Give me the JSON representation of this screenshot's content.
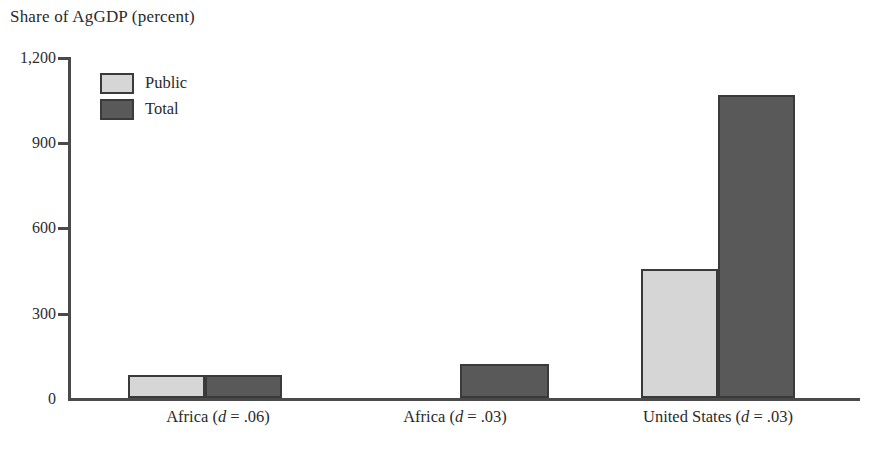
{
  "chart_data": {
    "type": "bar",
    "title": "Share of AgGDP (percent)",
    "xlabel": "",
    "ylabel": "Share of AgGDP (percent)",
    "ylim": [
      0,
      1200
    ],
    "yticks": [
      0,
      300,
      600,
      900,
      1200
    ],
    "ytick_labels": [
      "0",
      "300",
      "600",
      "900",
      "1,200"
    ],
    "grid": false,
    "legend_position": "upper-left",
    "categories": [
      "Africa (d = .06)",
      "Africa (d = .03)",
      "United States (d = .03)"
    ],
    "category_labels_rich": [
      {
        "prefix": "Africa (",
        "italic": "d",
        "suffix": " = .06)"
      },
      {
        "prefix": "Africa (",
        "italic": "d",
        "suffix": " = .03)"
      },
      {
        "prefix": "United States (",
        "italic": "d",
        "suffix": " = .03)"
      }
    ],
    "series": [
      {
        "name": "Public",
        "color": "#d6d6d6",
        "values": [
          80,
          0,
          455
        ]
      },
      {
        "name": "Total",
        "color": "#595959",
        "values": [
          82,
          120,
          1065
        ]
      }
    ]
  },
  "legend": {
    "items": [
      {
        "label": "Public",
        "color": "#d6d6d6"
      },
      {
        "label": "Total",
        "color": "#595959"
      }
    ]
  },
  "axis": {
    "tick_0": "0",
    "tick_300": "300",
    "tick_600": "600",
    "tick_900": "900",
    "tick_1200": "1,200"
  },
  "colors": {
    "public": "#d6d6d6",
    "total": "#595959",
    "axis": "#4a4a4a",
    "bar_outline": "#3a3a3a",
    "text": "#2a2a2a",
    "background": "#ffffff"
  }
}
